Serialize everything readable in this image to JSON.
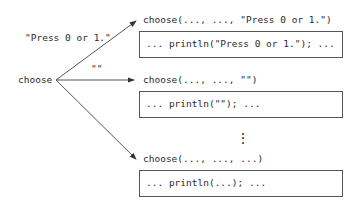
{
  "root": {
    "label": "choose"
  },
  "edges": [
    {
      "label": "\"Press 0 or 1.\""
    },
    {
      "label": "\"\""
    },
    {
      "label": ""
    }
  ],
  "branches": [
    {
      "call": "choose(..., ..., \"Press 0 or 1.\")",
      "body": "... println(\"Press 0 or 1.\"); ..."
    },
    {
      "call": "choose(..., ..., \"\")",
      "body": "... println(\"\"); ..."
    },
    {
      "call": "choose(..., ..., ...)",
      "body": "... println(...); ..."
    }
  ],
  "ellipsis": "⋮",
  "colors": {
    "line": "#444444",
    "text": "#2a2a2a",
    "border": "#555555"
  }
}
